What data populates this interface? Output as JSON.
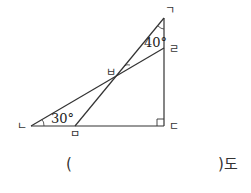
{
  "diagram": {
    "points": {
      "giyeok": {
        "label": "ㄱ",
        "x": 164,
        "y": 18
      },
      "rieul": {
        "label": "ㄹ",
        "x": 164,
        "y": 48
      },
      "digeut": {
        "label": "ㄷ",
        "x": 164,
        "y": 126
      },
      "nieun": {
        "label": "ㄴ",
        "x": 31,
        "y": 126
      },
      "mieum": {
        "label": "ㅁ",
        "x": 75,
        "y": 126
      },
      "bieup": {
        "label": "ㅂ",
        "x": 115,
        "y": 77
      }
    },
    "angles": {
      "angle_g": "40°",
      "angle_n": "30°"
    },
    "right_angle_at": "ㄷ",
    "stroke_color": "#333333"
  },
  "answer": {
    "open_paren": "(",
    "close_suffix": ")도"
  }
}
